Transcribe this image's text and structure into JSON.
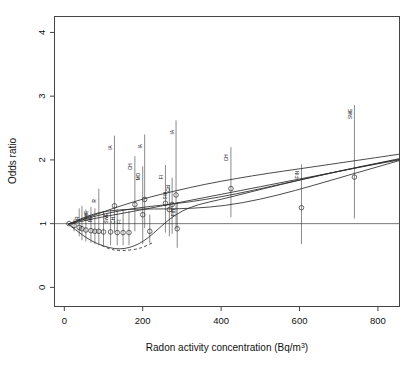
{
  "figure": {
    "title": "",
    "xlabel_main": "Radon activity concentration (Bq/m",
    "xlabel_unit_sup": "3",
    "xlabel_tail": ")",
    "ylabel": "Odds ratio",
    "reference_line_value": 1
  },
  "axes": {
    "x_ticks": [
      0,
      200,
      400,
      600,
      800
    ],
    "x_tick_labels": [
      "0",
      "200",
      "400",
      "600",
      "800"
    ],
    "y_ticks": [
      0,
      1,
      2,
      3,
      4
    ],
    "y_tick_labels": [
      "0",
      "1",
      "2",
      "3",
      "4"
    ],
    "xlim": [
      -25,
      855
    ],
    "ylim": [
      -0.3,
      4.25
    ]
  },
  "chart_data": {
    "type": "scatter",
    "title": "",
    "xlabel": "Radon activity concentration (Bq/m3)",
    "ylabel": "Odds ratio",
    "xlim": [
      -25,
      855
    ],
    "ylim": [
      -0.3,
      4.25
    ],
    "grid": false,
    "legend": "none",
    "reference_line": {
      "y": 1,
      "style": "solid",
      "color": "#555555"
    },
    "points": [
      {
        "label": "",
        "x": 12,
        "y": 1.0,
        "ci_low": 1.0,
        "ci_high": 1.0,
        "marker": "circle"
      },
      {
        "label": "",
        "x": 25,
        "y": 0.97,
        "ci_low": 0.88,
        "ci_high": 1.07,
        "marker": "circle"
      },
      {
        "label": "",
        "x": 38,
        "y": 0.94,
        "ci_low": 0.8,
        "ci_high": 1.24,
        "marker": "circle"
      },
      {
        "label": "R",
        "x": 45,
        "y": 0.92,
        "ci_low": 0.74,
        "ci_high": 1.28,
        "marker": "circle"
      },
      {
        "label": "",
        "x": 55,
        "y": 0.9,
        "ci_low": 0.72,
        "ci_high": 1.22,
        "marker": "circle"
      },
      {
        "label": "SWE",
        "x": 68,
        "y": 0.89,
        "ci_low": 0.7,
        "ci_high": 1.26,
        "marker": "circle"
      },
      {
        "label": "NO",
        "x": 78,
        "y": 0.88,
        "ci_low": 0.68,
        "ci_high": 1.24,
        "marker": "circle"
      },
      {
        "label": "R",
        "x": 88,
        "y": 0.88,
        "ci_low": 0.66,
        "ci_high": 1.55,
        "marker": "circle"
      },
      {
        "label": "",
        "x": 100,
        "y": 0.87,
        "ci_low": 0.66,
        "ci_high": 1.2,
        "marker": "circle"
      },
      {
        "label": "SWE",
        "x": 118,
        "y": 0.87,
        "ci_low": 0.66,
        "ci_high": 1.22,
        "marker": "circle"
      },
      {
        "label": "IA",
        "x": 128,
        "y": 1.28,
        "ci_low": 0.86,
        "ci_high": 2.38,
        "marker": "circle"
      },
      {
        "label": "CH",
        "x": 135,
        "y": 0.86,
        "ci_low": 0.66,
        "ci_high": 1.22,
        "marker": "circle"
      },
      {
        "label": "FI",
        "x": 150,
        "y": 0.86,
        "ci_low": 0.66,
        "ci_high": 1.22,
        "marker": "circle"
      },
      {
        "label": "",
        "x": 165,
        "y": 0.86,
        "ci_low": 0.66,
        "ci_high": 1.2,
        "marker": "circle"
      },
      {
        "label": "CH",
        "x": 180,
        "y": 1.3,
        "ci_low": 0.88,
        "ci_high": 2.06,
        "marker": "circle"
      },
      {
        "label": "MO",
        "x": 200,
        "y": 1.14,
        "ci_low": 0.68,
        "ci_high": 1.9,
        "marker": "circle"
      },
      {
        "label": "IA",
        "x": 205,
        "y": 1.38,
        "ci_low": 0.93,
        "ci_high": 2.4,
        "marker": "circle"
      },
      {
        "label": "",
        "x": 218,
        "y": 0.88,
        "ci_low": 0.7,
        "ci_high": 1.14,
        "marker": "circle"
      },
      {
        "label": "FI",
        "x": 258,
        "y": 1.32,
        "ci_low": 0.86,
        "ci_high": 1.92,
        "marker": "circle"
      },
      {
        "label": "SW",
        "x": 268,
        "y": 1.22,
        "ci_low": 0.8,
        "ci_high": 1.6,
        "marker": "circle"
      },
      {
        "label": "CH",
        "x": 275,
        "y": 1.3,
        "ci_low": 0.84,
        "ci_high": 1.72,
        "marker": "circle"
      },
      {
        "label": "IA",
        "x": 285,
        "y": 1.45,
        "ci_low": 0.92,
        "ci_high": 2.62,
        "marker": "circle"
      },
      {
        "label": "FIN",
        "x": 288,
        "y": 0.92,
        "ci_low": 0.62,
        "ci_high": 1.34,
        "marker": "circle"
      },
      {
        "label": "CH",
        "x": 425,
        "y": 1.55,
        "ci_low": 1.1,
        "ci_high": 2.2,
        "marker": "circle"
      },
      {
        "label": "FIN",
        "x": 605,
        "y": 1.25,
        "ci_low": 0.68,
        "ci_high": 1.93,
        "marker": "circle"
      },
      {
        "label": "SWE",
        "x": 740,
        "y": 1.73,
        "ci_low": 1.08,
        "ci_high": 2.86,
        "marker": "circle"
      }
    ],
    "curves": [
      {
        "name": "linear-model",
        "style": "solid",
        "points": [
          [
            10,
            0.99
          ],
          [
            60,
            1.06
          ],
          [
            120,
            1.13
          ],
          [
            200,
            1.22
          ],
          [
            300,
            1.34
          ],
          [
            400,
            1.46
          ],
          [
            500,
            1.58
          ],
          [
            600,
            1.7
          ],
          [
            700,
            1.82
          ],
          [
            800,
            1.94
          ],
          [
            855,
            2.0
          ]
        ]
      },
      {
        "name": "upper-spline",
        "style": "solid",
        "points": [
          [
            10,
            0.99
          ],
          [
            40,
            1.06
          ],
          [
            80,
            1.14
          ],
          [
            120,
            1.23
          ],
          [
            170,
            1.33
          ],
          [
            220,
            1.42
          ],
          [
            280,
            1.51
          ],
          [
            360,
            1.62
          ],
          [
            440,
            1.71
          ],
          [
            520,
            1.79
          ],
          [
            600,
            1.86
          ],
          [
            700,
            1.95
          ],
          [
            800,
            2.04
          ],
          [
            855,
            2.09
          ]
        ]
      },
      {
        "name": "mid-spline",
        "style": "solid",
        "points": [
          [
            10,
            0.99
          ],
          [
            40,
            1.05
          ],
          [
            80,
            1.12
          ],
          [
            130,
            1.19
          ],
          [
            190,
            1.25
          ],
          [
            250,
            1.29
          ],
          [
            320,
            1.34
          ],
          [
            400,
            1.42
          ],
          [
            480,
            1.52
          ],
          [
            560,
            1.63
          ],
          [
            640,
            1.74
          ],
          [
            720,
            1.85
          ],
          [
            800,
            1.95
          ],
          [
            855,
            2.02
          ]
        ]
      },
      {
        "name": "flat-spline",
        "style": "solid",
        "points": [
          [
            10,
            0.99
          ],
          [
            50,
            1.1
          ],
          [
            90,
            1.18
          ],
          [
            140,
            1.22
          ],
          [
            200,
            1.23
          ],
          [
            260,
            1.23
          ],
          [
            330,
            1.24
          ],
          [
            410,
            1.28
          ],
          [
            500,
            1.38
          ],
          [
            590,
            1.52
          ],
          [
            680,
            1.68
          ],
          [
            770,
            1.84
          ],
          [
            855,
            1.99
          ]
        ]
      },
      {
        "name": "lower-solid-envelope",
        "style": "solid",
        "points": [
          [
            10,
            0.99
          ],
          [
            30,
            0.9
          ],
          [
            55,
            0.78
          ],
          [
            85,
            0.68
          ],
          [
            115,
            0.62
          ],
          [
            140,
            0.6
          ],
          [
            165,
            0.62
          ],
          [
            190,
            0.68
          ],
          [
            215,
            0.78
          ],
          [
            240,
            0.92
          ],
          [
            270,
            1.08
          ],
          [
            300,
            1.2
          ],
          [
            340,
            1.3
          ],
          [
            400,
            1.38
          ],
          [
            470,
            1.49
          ],
          [
            550,
            1.61
          ],
          [
            640,
            1.74
          ],
          [
            730,
            1.86
          ],
          [
            820,
            1.97
          ],
          [
            855,
            2.01
          ]
        ]
      },
      {
        "name": "lower-dashed-envelope",
        "style": "dashed",
        "points": [
          [
            95,
            0.66
          ],
          [
            115,
            0.6
          ],
          [
            135,
            0.58
          ],
          [
            160,
            0.58
          ],
          [
            185,
            0.6
          ],
          [
            205,
            0.64
          ],
          [
            225,
            0.7
          ]
        ]
      }
    ]
  },
  "style": {
    "line_color": "#2b2b2b",
    "point_color": "#2b2b2b",
    "reference_color": "#555555",
    "axis_color": "#444444",
    "background": "#ffffff"
  }
}
